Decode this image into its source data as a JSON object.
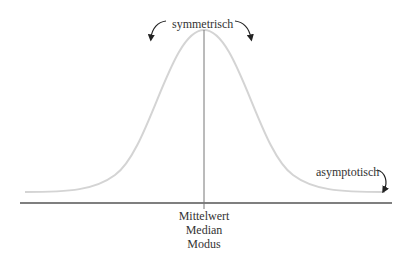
{
  "diagram": {
    "type": "normal-distribution-annotated",
    "colors": {
      "curve": "#d4d4d4",
      "axis": "#555555",
      "center_line": "#777777",
      "arrows": "#222222",
      "text": "#333333"
    },
    "labels": {
      "symmetry": "symmetrisch",
      "asymptote": "asymptotisch",
      "center": [
        "Mittelwert",
        "Median",
        "Modus"
      ]
    }
  }
}
